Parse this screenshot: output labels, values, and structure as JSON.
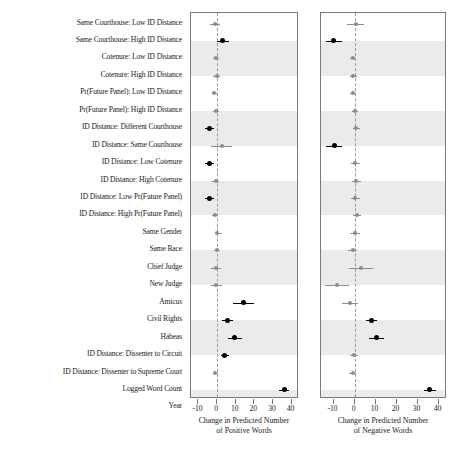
{
  "figure": {
    "title": "",
    "row_labels": [
      "Same Courthouse: Low ID Distance",
      "Same Courthouse: High ID Distance",
      "Cotenure: Low ID Distance",
      "Cotenure: High ID Distance",
      "Pr(Future Panel): Low ID Distance",
      "Pr(Future Panel): High ID Distance",
      "ID Distance: Different Courthouse",
      "ID Distance: Same Courthouse",
      "ID Distance: Low Cotenure",
      "ID Distance: High Cotenure",
      "ID Distance: Low Pr(Future Panel)",
      "ID Distance: High Pr(Future Panel)",
      "Same Gender",
      "Same Race",
      "Chief Judge",
      "New Judge",
      "Amicus",
      "Civil Rights",
      "Habeas",
      "ID Distance: Dissenter to Circuit",
      "ID Distance: Dissenter to Supreme Court",
      "Logged Word Count",
      "Year"
    ],
    "colors": {
      "significant": "#000000",
      "nonsignificant": "#8d8d8d",
      "band": "#ebebeb",
      "frame": "#7a7a7a",
      "zeroline": "#9a9a9a"
    }
  },
  "chart_data": [
    {
      "type": "scatter",
      "panel": "left",
      "title": "",
      "xlabel_lines": [
        "Change in Predicted Number",
        "of Positive Words"
      ],
      "ylabel": "",
      "xlim": [
        -14,
        44
      ],
      "xticks": [
        -10,
        0,
        10,
        20,
        30,
        40
      ],
      "xticklabels": [
        "-10",
        "0",
        "10",
        "20",
        "30",
        "40"
      ],
      "grid": false,
      "zero_reference": 0,
      "categories": [
        "Same Courthouse: Low ID Distance",
        "Same Courthouse: High ID Distance",
        "Cotenure: Low ID Distance",
        "Cotenure: High ID Distance",
        "Pr(Future Panel): Low ID Distance",
        "Pr(Future Panel): High ID Distance",
        "ID Distance: Different Courthouse",
        "ID Distance: Same Courthouse",
        "ID Distance: Low Cotenure",
        "ID Distance: High Cotenure",
        "ID Distance: Low Pr(Future Panel)",
        "ID Distance: High Pr(Future Panel)",
        "Same Gender",
        "Same Race",
        "Chief Judge",
        "New Judge",
        "Amicus",
        "Civil Rights",
        "Habeas",
        "ID Distance: Dissenter to Circuit",
        "ID Distance: Dissenter to Supreme Court",
        "Logged Word Count",
        "Year"
      ],
      "estimates": [
        -1.2,
        2.8,
        -0.5,
        -0.3,
        -1.5,
        -0.6,
        -4.0,
        2.5,
        -4.2,
        -0.8,
        -4.3,
        -1.1,
        0.2,
        -0.2,
        -0.6,
        -0.5,
        14.2,
        5.4,
        9.6,
        4.2,
        -0.9,
        36.0,
        -0.4
      ],
      "ci_low": [
        -4.0,
        0.2,
        -2.0,
        -2.2,
        -2.8,
        -2.2,
        -6.5,
        -3.0,
        -6.6,
        -2.6,
        -6.6,
        -2.8,
        -1.2,
        -1.8,
        -3.2,
        -3.4,
        8.6,
        2.4,
        6.0,
        2.0,
        -2.4,
        33.4,
        -2.0
      ],
      "ci_high": [
        1.6,
        6.6,
        1.0,
        1.6,
        0.0,
        1.0,
        -1.5,
        8.0,
        -1.8,
        1.0,
        -1.9,
        0.6,
        2.6,
        1.4,
        2.0,
        2.4,
        20.0,
        8.4,
        13.4,
        6.4,
        0.6,
        38.6,
        1.2
      ],
      "significant": [
        false,
        true,
        false,
        false,
        false,
        false,
        true,
        false,
        true,
        false,
        true,
        false,
        false,
        false,
        false,
        false,
        true,
        true,
        true,
        true,
        false,
        true,
        false
      ]
    },
    {
      "type": "scatter",
      "panel": "right",
      "title": "",
      "xlabel_lines": [
        "Change in Predicted Number",
        "of Negative Words"
      ],
      "ylabel": "",
      "xlim": [
        -16,
        44
      ],
      "xticks": [
        -10,
        0,
        10,
        20,
        30,
        40
      ],
      "xticklabels": [
        "-10",
        "0",
        "10",
        "20",
        "30",
        "40"
      ],
      "grid": false,
      "zero_reference": 0,
      "categories": [
        "Same Courthouse: Low ID Distance",
        "Same Courthouse: High ID Distance",
        "Cotenure: Low ID Distance",
        "Cotenure: High ID Distance",
        "Pr(Future Panel): Low ID Distance",
        "Pr(Future Panel): High ID Distance",
        "ID Distance: Different Courthouse",
        "ID Distance: Same Courthouse",
        "ID Distance: Low Cotenure",
        "ID Distance: High Cotenure",
        "ID Distance: Low Pr(Future Panel)",
        "ID Distance: High Pr(Future Panel)",
        "Same Gender",
        "Same Race",
        "Chief Judge",
        "New Judge",
        "Amicus",
        "Civil Rights",
        "Habeas",
        "ID Distance: Dissenter to Circuit",
        "ID Distance: Dissenter to Supreme Court",
        "Logged Word Count",
        "Year"
      ],
      "estimates": [
        0.6,
        -10.0,
        -0.8,
        -0.6,
        -0.7,
        0.1,
        0.9,
        -9.8,
        0.4,
        0.9,
        0.4,
        1.1,
        0.0,
        -0.9,
        3.0,
        -8.5,
        -2.2,
        8.0,
        10.6,
        -0.4,
        -1.0,
        35.8,
        0.2
      ],
      "ci_low": [
        -3.4,
        -13.8,
        -2.4,
        -2.4,
        -2.2,
        -1.4,
        -0.8,
        -13.6,
        -1.6,
        -1.2,
        -1.6,
        -1.0,
        -2.4,
        -3.0,
        -2.6,
        -14.2,
        -6.0,
        5.4,
        7.0,
        -2.2,
        -2.6,
        33.0,
        -1.6
      ],
      "ci_high": [
        4.6,
        -6.2,
        0.8,
        1.2,
        0.8,
        1.6,
        2.6,
        -6.0,
        2.4,
        3.0,
        2.4,
        3.2,
        2.4,
        1.2,
        8.6,
        -2.8,
        1.6,
        10.6,
        14.2,
        1.4,
        0.6,
        38.6,
        2.0
      ],
      "significant": [
        false,
        true,
        false,
        false,
        false,
        false,
        false,
        true,
        false,
        false,
        false,
        false,
        false,
        false,
        false,
        false,
        false,
        true,
        true,
        false,
        false,
        true,
        false
      ]
    }
  ]
}
